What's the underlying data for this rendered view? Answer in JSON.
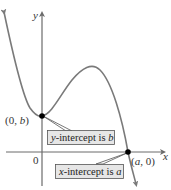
{
  "diagram": {
    "type": "graph-of-function-with-intercepts",
    "axes": {
      "x_label": "x",
      "y_label": "y",
      "origin_label": "0",
      "axis_color": "#6b6b6b"
    },
    "curve": {
      "color": "#7a7a7a",
      "description": "polynomial-like curve decreasing to local min near y-intercept, rising to local max, then falling through x-intercept"
    },
    "points": [
      {
        "id": "y-intercept",
        "label": "(0, b)",
        "label_parts": [
          "(0, ",
          "b",
          ")"
        ]
      },
      {
        "id": "x-intercept",
        "label": "(a, 0)",
        "label_parts": [
          "(",
          "a",
          ", 0)"
        ]
      }
    ],
    "callouts": [
      {
        "id": "y-intercept-callout",
        "text_parts": [
          "y",
          "-intercept is ",
          "b"
        ],
        "text": "y-intercept is b",
        "box_fill": "#e6e6e6",
        "box_stroke": "#555555"
      },
      {
        "id": "x-intercept-callout",
        "text_parts": [
          "x",
          "-intercept is ",
          "a"
        ],
        "text": "x-intercept is a",
        "box_fill": "#e6e6e6",
        "box_stroke": "#555555"
      }
    ],
    "point_color": "#000000"
  }
}
